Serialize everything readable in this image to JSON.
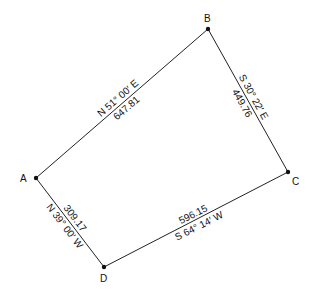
{
  "diagram": {
    "type": "survey-traverse",
    "points": {
      "A": {
        "label": "A",
        "x": 36,
        "y": 178
      },
      "B": {
        "label": "B",
        "x": 208,
        "y": 29
      },
      "C": {
        "label": "C",
        "x": 288,
        "y": 172
      },
      "D": {
        "label": "D",
        "x": 104,
        "y": 267
      }
    },
    "courses": [
      {
        "from": "A",
        "to": "B",
        "bearing": "N 51° 00′ E",
        "distance": "647.81"
      },
      {
        "from": "B",
        "to": "C",
        "bearing": "S 30° 22′ E",
        "distance": "449.76"
      },
      {
        "from": "C",
        "to": "D",
        "bearing": "S 64° 14′ W",
        "distance": "596.15"
      },
      {
        "from": "D",
        "to": "A",
        "bearing": "N 39° 00′ W",
        "distance": "309.17"
      }
    ],
    "colors": {
      "line": "#222222",
      "text": "#111111",
      "background": "#ffffff"
    }
  }
}
